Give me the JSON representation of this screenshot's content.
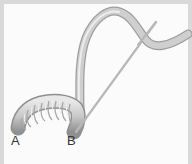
{
  "diagram": {
    "labels": [
      {
        "id": "A",
        "text": "A"
      },
      {
        "id": "B",
        "text": "B"
      }
    ],
    "colors": {
      "frame": "#d9d9d9",
      "background": "#fbfbfb",
      "tube": "#c9c9c9",
      "tube_highlight": "#ececec",
      "tube_shadow": "#9a9a9a",
      "rod": "#b5b5b5",
      "label": "#333333"
    }
  }
}
